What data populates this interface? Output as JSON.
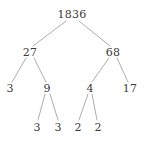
{
  "figure": {
    "kind": "binary-tree-diagram",
    "width": 145,
    "height": 141,
    "background_color": "#ffffff",
    "text_color": "#3b3b3b",
    "edge_color": "#8a8a8a",
    "edge_width": 0.7
  },
  "chart_data": {
    "type": "diagram",
    "subtype": "tree",
    "title": "",
    "root": "1836",
    "nodes": [
      {
        "id": "n0",
        "label": "1836",
        "level": 0,
        "x": 72,
        "y": 14
      },
      {
        "id": "n1",
        "label": "27",
        "level": 1,
        "x": 30,
        "y": 52
      },
      {
        "id": "n2",
        "label": "68",
        "level": 1,
        "x": 113,
        "y": 52
      },
      {
        "id": "n3",
        "label": "3",
        "level": 2,
        "x": 10,
        "y": 88
      },
      {
        "id": "n4",
        "label": "9",
        "level": 2,
        "x": 47,
        "y": 88
      },
      {
        "id": "n5",
        "label": "4",
        "level": 2,
        "x": 90,
        "y": 88
      },
      {
        "id": "n6",
        "label": "17",
        "level": 2,
        "x": 130,
        "y": 88
      },
      {
        "id": "n7",
        "label": "3",
        "level": 3,
        "x": 37,
        "y": 127
      },
      {
        "id": "n8",
        "label": "3",
        "level": 3,
        "x": 58,
        "y": 127
      },
      {
        "id": "n9",
        "label": "2",
        "level": 3,
        "x": 78,
        "y": 127
      },
      {
        "id": "n10",
        "label": "2",
        "level": 3,
        "x": 98,
        "y": 127
      }
    ],
    "edges": [
      {
        "from": "n0",
        "to": "n1",
        "x1": 66,
        "y1": 21,
        "x2": 33,
        "y2": 46
      },
      {
        "from": "n0",
        "to": "n2",
        "x1": 79,
        "y1": 21,
        "x2": 110,
        "y2": 46
      },
      {
        "from": "n1",
        "to": "n3",
        "x1": 26,
        "y1": 58,
        "x2": 12,
        "y2": 82
      },
      {
        "from": "n1",
        "to": "n4",
        "x1": 34,
        "y1": 58,
        "x2": 46,
        "y2": 82
      },
      {
        "from": "n2",
        "to": "n5",
        "x1": 109,
        "y1": 58,
        "x2": 92,
        "y2": 82
      },
      {
        "from": "n2",
        "to": "n6",
        "x1": 117,
        "y1": 58,
        "x2": 128,
        "y2": 82
      },
      {
        "from": "n4",
        "to": "n7",
        "x1": 45,
        "y1": 94,
        "x2": 38,
        "y2": 120
      },
      {
        "from": "n4",
        "to": "n8",
        "x1": 50,
        "y1": 94,
        "x2": 58,
        "y2": 120
      },
      {
        "from": "n5",
        "to": "n9",
        "x1": 88,
        "y1": 94,
        "x2": 79,
        "y2": 120
      },
      {
        "from": "n5",
        "to": "n10",
        "x1": 92,
        "y1": 94,
        "x2": 97,
        "y2": 120
      }
    ],
    "levels": [
      {
        "level": 0,
        "labels": [
          "1836"
        ]
      },
      {
        "level": 1,
        "labels": [
          "27",
          "68"
        ]
      },
      {
        "level": 2,
        "labels": [
          "3",
          "9",
          "4",
          "17"
        ]
      },
      {
        "level": 3,
        "labels": [
          "3",
          "3",
          "2",
          "2"
        ]
      }
    ],
    "values": [
      1836,
      27,
      68,
      3,
      9,
      4,
      17,
      3,
      3,
      2,
      2
    ]
  }
}
